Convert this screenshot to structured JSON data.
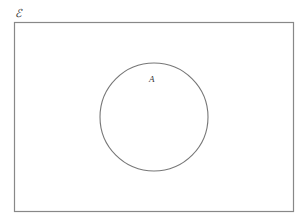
{
  "diagram": {
    "type": "venn",
    "universal_set": {
      "label": "ℰ"
    },
    "sets": [
      {
        "label": "A"
      }
    ]
  }
}
